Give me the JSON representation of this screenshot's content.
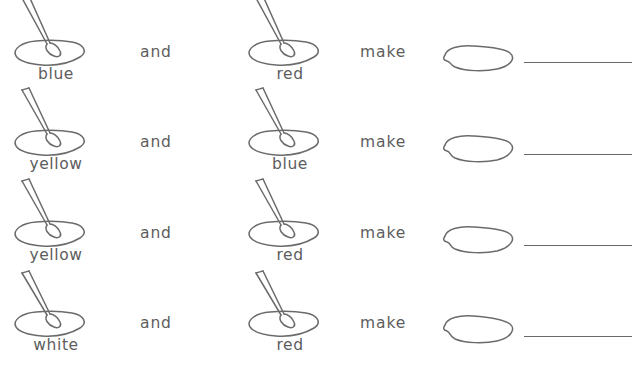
{
  "worksheet": {
    "connector_and": "and",
    "connector_make": "make",
    "ink_color": "#5d5d5d",
    "line_color": "#6a6a6a",
    "background": "#ffffff",
    "rows": [
      {
        "color_a": "blue",
        "color_b": "red",
        "answer": ""
      },
      {
        "color_a": "yellow",
        "color_b": "blue",
        "answer": ""
      },
      {
        "color_a": "yellow",
        "color_b": "red",
        "answer": ""
      },
      {
        "color_a": "white",
        "color_b": "red",
        "answer": ""
      }
    ],
    "icons": {
      "palette_with_brush": "paint-palette-brush-icon",
      "empty_palette": "empty-paint-palette-icon",
      "answer_blank": "answer-write-on-line"
    }
  }
}
